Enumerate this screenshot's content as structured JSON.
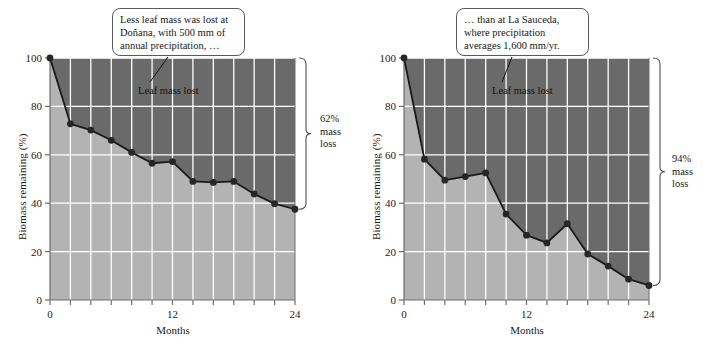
{
  "figure": {
    "panels": [
      {
        "id": "donana",
        "callout_text": "Less leaf mass was lost at\nDoñana, with 500 mm of\nannual precipitation, …",
        "inline_label": "Leaf mass lost",
        "bracket_label": "62%\nmass\nloss",
        "axis": {
          "ylabel": "Biomass remaining (%)",
          "xlabel": "Months",
          "yticks": [
            "0",
            "20",
            "40",
            "60",
            "80",
            "100"
          ],
          "xticks": [
            "0",
            "12",
            "24"
          ]
        }
      },
      {
        "id": "la-sauceda",
        "callout_text": "… than at La Sauceda,\nwhere precipitation\naverages 1,600 mm/yr.",
        "inline_label": "Leaf mass lost",
        "bracket_label": "94%\nmass\nloss",
        "axis": {
          "ylabel": "Biomass remaining (%)",
          "xlabel": "Months",
          "yticks": [
            "0",
            "20",
            "40",
            "60",
            "80",
            "100"
          ],
          "xticks": [
            "0",
            "12",
            "24"
          ]
        }
      }
    ]
  },
  "colors": {
    "remaining_fill": "#b3b3b3",
    "lost_fill": "#6a6a6a",
    "gridline": "#ffffff",
    "line": "#1a1a1a",
    "marker": "#262626",
    "axis": "#6e6e6e",
    "text": "#1a1a1a"
  },
  "chart_data": [
    {
      "type": "area",
      "title": "Doñana",
      "xlabel": "Months",
      "ylabel": "Biomass remaining (%)",
      "xlim": [
        0,
        24
      ],
      "ylim": [
        0,
        100
      ],
      "yticks": [
        0,
        20,
        40,
        60,
        80,
        100
      ],
      "xticks": [
        0,
        12,
        24
      ],
      "xtick_minor_step": 2,
      "grid": true,
      "legend": "none",
      "annotations": [
        "Less leaf mass was lost at Doñana, with 500 mm of annual precipitation, …",
        "Leaf mass lost",
        "62% mass loss"
      ],
      "series": [
        {
          "name": "Biomass remaining (%)",
          "x": [
            0,
            2,
            4,
            6,
            8,
            10,
            12,
            14,
            16,
            18,
            20,
            22,
            24
          ],
          "values": [
            100,
            72.8,
            70.2,
            66.0,
            61.0,
            56.5,
            57.2,
            49.0,
            48.6,
            49.0,
            43.8,
            39.8,
            37.5
          ]
        }
      ]
    },
    {
      "type": "area",
      "title": "La Sauceda",
      "xlabel": "Months",
      "ylabel": "Biomass remaining (%)",
      "xlim": [
        0,
        24
      ],
      "ylim": [
        0,
        100
      ],
      "yticks": [
        0,
        20,
        40,
        60,
        80,
        100
      ],
      "xticks": [
        0,
        12,
        24
      ],
      "xtick_minor_step": 2,
      "grid": true,
      "legend": "none",
      "annotations": [
        "… than at La Sauceda, where precipitation averages 1,600 mm/yr.",
        "Leaf mass lost",
        "94% mass loss"
      ],
      "series": [
        {
          "name": "Biomass remaining (%)",
          "x": [
            0,
            2,
            4,
            6,
            8,
            10,
            12,
            14,
            16,
            18,
            20,
            22,
            24
          ],
          "values": [
            100,
            58.2,
            49.5,
            51.0,
            52.5,
            35.5,
            26.8,
            23.6,
            31.5,
            19.0,
            14.0,
            8.6,
            6.0
          ]
        }
      ]
    }
  ]
}
